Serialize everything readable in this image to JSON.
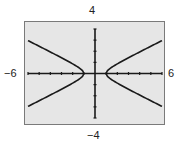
{
  "window": {
    "xmin_label": "−6",
    "xmax_label": "6",
    "ymax_label": "4",
    "ymin_label": "−4"
  },
  "colors": {
    "screen_bg": "#e6e6e6",
    "frame": "#7a7a7a",
    "curve": "#1a1a1a",
    "axes": "#1a1a1a"
  },
  "chart_data": {
    "type": "line",
    "title": "",
    "xlabel": "",
    "ylabel": "",
    "xlim": [
      -6,
      6
    ],
    "ylim": [
      -4,
      4
    ],
    "xtick_step": 1,
    "ytick_step": 1,
    "grid": false,
    "legend": null,
    "annotations": [
      "-6",
      "6",
      "4",
      "-4"
    ],
    "equation_estimate": "x^2 - 4y^2 = 1 (horizontal hyperbola, vertices at (±1, 0))",
    "series": [
      {
        "name": "upper-right branch",
        "x": [
          1,
          1.5,
          2,
          3,
          4,
          5,
          6
        ],
        "y": [
          0,
          0.56,
          0.87,
          1.41,
          1.94,
          2.45,
          2.96
        ]
      },
      {
        "name": "lower-right branch",
        "x": [
          1,
          1.5,
          2,
          3,
          4,
          5,
          6
        ],
        "y": [
          0,
          -0.56,
          -0.87,
          -1.41,
          -1.94,
          -2.45,
          -2.96
        ]
      },
      {
        "name": "upper-left branch",
        "x": [
          -1,
          -1.5,
          -2,
          -3,
          -4,
          -5,
          -6
        ],
        "y": [
          0,
          0.56,
          0.87,
          1.41,
          1.94,
          2.45,
          2.96
        ]
      },
      {
        "name": "lower-left branch",
        "x": [
          -1,
          -1.5,
          -2,
          -3,
          -4,
          -5,
          -6
        ],
        "y": [
          0,
          -0.56,
          -0.87,
          -1.41,
          -1.94,
          -2.45,
          -2.96
        ]
      }
    ]
  }
}
